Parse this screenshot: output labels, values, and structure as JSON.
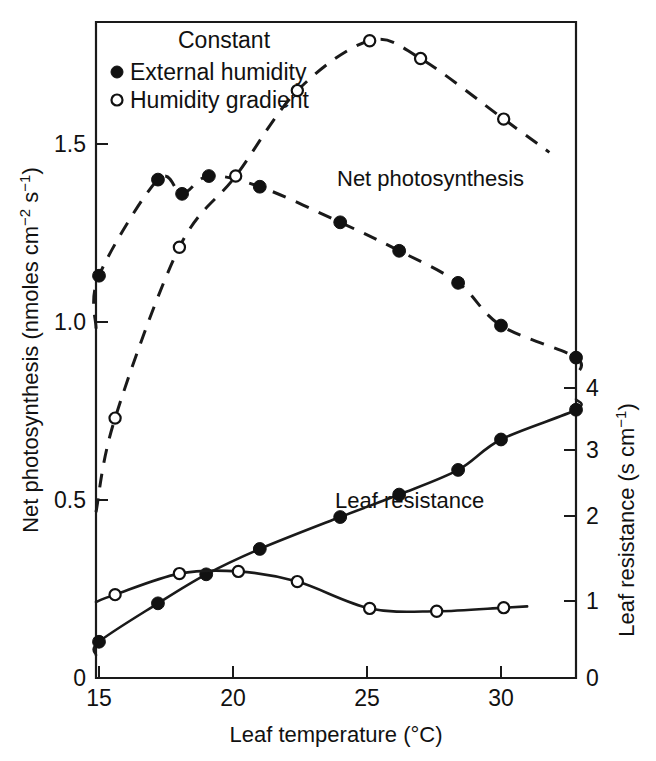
{
  "figure": {
    "background": "#ffffff",
    "ink_color": "#111111"
  },
  "legend": {
    "title": "Constant",
    "entries": [
      {
        "marker": "filled-circle",
        "label": "External humidity"
      },
      {
        "marker": "open-circle",
        "label": "Humidity gradient"
      }
    ]
  },
  "annotations": [
    {
      "name": "net-photosynthesis-label",
      "text": "Net photosynthesis",
      "x": 25.6,
      "axis": "left"
    },
    {
      "name": "leaf-resistance-label",
      "text": "Leaf resistance",
      "x": 25.4,
      "axis": "right"
    }
  ],
  "axes": {
    "x": {
      "title": "Leaf temperature (°C)",
      "ticks": [
        15,
        20,
        25,
        30
      ],
      "tick_labels": [
        "15",
        "20",
        "25",
        "30"
      ],
      "range": [
        15,
        32.8
      ]
    },
    "y_left": {
      "title_parts": {
        "main": "Net photosynthesis (nmoles cm",
        "sup1": "−2",
        "mid": " s",
        "sup2": "−1",
        "tail": ")"
      },
      "title_plain": "Net photosynthesis (nmoles cm−2 s−1)",
      "ticks": [
        0,
        0.5,
        1.0,
        1.5
      ],
      "tick_labels": [
        "0",
        "0.5",
        "1.0",
        "1.5"
      ],
      "range": [
        0,
        1.9
      ]
    },
    "y_right": {
      "title_parts": {
        "main": "Leaf resistance (s cm",
        "sup1": "−1",
        "tail": ")"
      },
      "title_plain": "Leaf resistance (s cm−1)",
      "ticks": [
        0,
        1,
        2,
        3,
        4
      ],
      "tick_labels": [
        "0",
        "1",
        "2",
        "3",
        "4"
      ],
      "range": [
        0,
        4.65
      ]
    }
  },
  "chart_data": {
    "type": "scatter",
    "title": "",
    "xlabel": "Leaf temperature (°C)",
    "ylabel": "Net photosynthesis (nmoles cm-2 s-1)",
    "ylabel_right": "Leaf resistance (s cm-1)",
    "xlim": [
      15,
      32.8
    ],
    "ylim": [
      0,
      1.9
    ],
    "ylim_right": [
      0,
      4.65
    ],
    "grid": false,
    "legend_position": "top-left",
    "series": [
      {
        "name": "Net photosynthesis — External humidity",
        "marker": "filled-circle",
        "line": "dashed",
        "axis": "left",
        "x": [
          15.0,
          17.2,
          18.1,
          19.1,
          21.0,
          24.0,
          26.2,
          28.4,
          30.0,
          32.8
        ],
        "values": [
          1.13,
          1.4,
          1.36,
          1.41,
          1.38,
          1.28,
          1.2,
          1.11,
          0.99,
          0.9
        ]
      },
      {
        "name": "Net photosynthesis — Humidity gradient",
        "marker": "open-circle",
        "line": "dashed",
        "axis": "left",
        "x": [
          15.6,
          18.0,
          20.1,
          22.4,
          25.1,
          27.0,
          30.1
        ],
        "values": [
          0.73,
          1.21,
          1.41,
          1.65,
          1.79,
          1.74,
          1.57
        ]
      },
      {
        "name": "Leaf resistance — External humidity",
        "marker": "filled-circle",
        "line": "solid",
        "axis": "right",
        "x": [
          15.0,
          17.2,
          19.0,
          21.0,
          24.0,
          26.2,
          28.4,
          30.0,
          32.8
        ],
        "values": [
          0.5,
          1.03,
          1.43,
          1.78,
          2.22,
          2.53,
          2.87,
          3.29,
          3.7
        ]
      },
      {
        "name": "Leaf resistance — Humidity gradient",
        "marker": "open-circle",
        "line": "solid",
        "axis": "right",
        "x": [
          15.6,
          18.0,
          20.2,
          22.4,
          25.1,
          27.6,
          30.1
        ],
        "values": [
          1.15,
          1.44,
          1.47,
          1.33,
          0.96,
          0.92,
          0.97
        ]
      }
    ]
  }
}
